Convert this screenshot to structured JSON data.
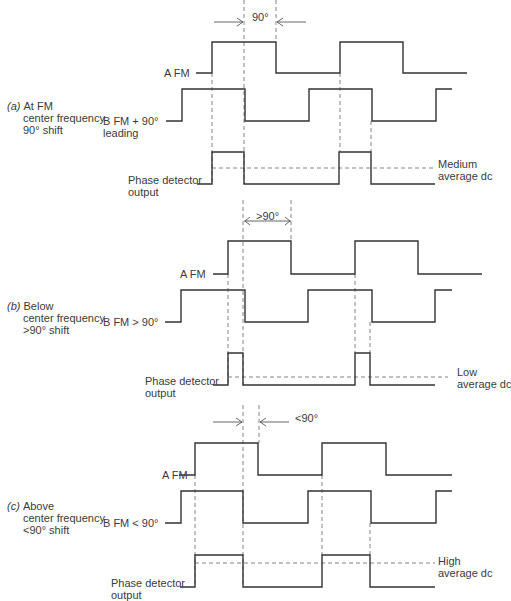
{
  "sections": [
    {
      "id": "a",
      "tag": "(a)",
      "title_lines": [
        "At FM",
        "center frequency",
        "90° shift"
      ],
      "signal_a_label": "A   FM",
      "signal_b_label_lines": [
        "B   FM + 90°",
        "leading"
      ],
      "output_label_lines": [
        "Phase detector",
        "output"
      ],
      "result_lines": [
        "Medium",
        "average dc"
      ],
      "angle_label": "90°",
      "arrow_style": "converging",
      "geom": {
        "a": {
          "hi": 42,
          "lo": 73,
          "pts": [
            [
              196,
              "lo"
            ],
            [
              212,
              "lo"
            ],
            [
              212,
              "hi"
            ],
            [
              276,
              "hi"
            ],
            [
              276,
              "lo"
            ],
            [
              340,
              "lo"
            ],
            [
              340,
              "hi"
            ],
            [
              403,
              "hi"
            ],
            [
              403,
              "lo"
            ],
            [
              467,
              "lo"
            ]
          ]
        },
        "b": {
          "hi": 89,
          "lo": 121,
          "pts": [
            [
              166,
              "lo"
            ],
            [
              182,
              "lo"
            ],
            [
              182,
              "hi"
            ],
            [
              245,
              "hi"
            ],
            [
              245,
              "lo"
            ],
            [
              309,
              "lo"
            ],
            [
              309,
              "hi"
            ],
            [
              372,
              "hi"
            ],
            [
              372,
              "lo"
            ],
            [
              436,
              "lo"
            ],
            [
              436,
              "hi"
            ],
            [
              452,
              "hi"
            ]
          ]
        },
        "out": {
          "hi": 152,
          "lo": 184,
          "pts": [
            [
              197,
              "lo"
            ],
            [
              212,
              "lo"
            ],
            [
              212,
              "hi"
            ],
            [
              244,
              "hi"
            ],
            [
              244,
              "lo"
            ],
            [
              339,
              "lo"
            ],
            [
              339,
              "hi"
            ],
            [
              371,
              "hi"
            ],
            [
              371,
              "lo"
            ],
            [
              435,
              "lo"
            ]
          ]
        },
        "avg": {
          "y": 168,
          "x1": 212,
          "x2": 435
        },
        "vdash": [
          [
            212,
            73,
            184
          ],
          [
            244,
            0,
            184
          ],
          [
            276,
            0,
            42
          ],
          [
            340,
            73,
            152
          ],
          [
            371,
            121,
            152
          ]
        ],
        "arrow": {
          "y": 22,
          "x1": 244,
          "x2": 276,
          "text_x": 252,
          "text_y": 12
        }
      },
      "label_pos": {
        "title": [
          7,
          100
        ],
        "a": [
          164,
          67
        ],
        "b": [
          103,
          115
        ],
        "out": [
          128,
          174
        ],
        "result": [
          438,
          158
        ]
      }
    },
    {
      "id": "b",
      "tag": "(b)",
      "title_lines": [
        "Below",
        "center frequency",
        ">90° shift"
      ],
      "signal_a_label": "A   FM",
      "signal_b_label_lines": [
        "B   FM > 90°"
      ],
      "output_label_lines": [
        "Phase detector",
        "output"
      ],
      "result_lines": [
        "Low",
        "average dc"
      ],
      "angle_label": ">90°",
      "arrow_style": "double",
      "geom": {
        "a": {
          "hi": 241,
          "lo": 274,
          "pts": [
            [
              213,
              "lo"
            ],
            [
              228,
              "lo"
            ],
            [
              228,
              "hi"
            ],
            [
              291,
              "hi"
            ],
            [
              291,
              "lo"
            ],
            [
              355,
              "lo"
            ],
            [
              355,
              "hi"
            ],
            [
              418,
              "hi"
            ],
            [
              418,
              "lo"
            ],
            [
              482,
              "lo"
            ]
          ]
        },
        "b": {
          "hi": 290,
          "lo": 322,
          "pts": [
            [
              165,
              "lo"
            ],
            [
              181,
              "lo"
            ],
            [
              181,
              "hi"
            ],
            [
              245,
              "hi"
            ],
            [
              245,
              "lo"
            ],
            [
              308,
              "lo"
            ],
            [
              308,
              "hi"
            ],
            [
              372,
              "hi"
            ],
            [
              372,
              "lo"
            ],
            [
              435,
              "lo"
            ],
            [
              435,
              "hi"
            ],
            [
              452,
              "hi"
            ]
          ]
        },
        "out": {
          "hi": 353,
          "lo": 385,
          "pts": [
            [
              213,
              "lo"
            ],
            [
              228,
              "lo"
            ],
            [
              228,
              "hi"
            ],
            [
              243,
              "hi"
            ],
            [
              243,
              "lo"
            ],
            [
              355,
              "lo"
            ],
            [
              355,
              "hi"
            ],
            [
              370,
              "hi"
            ],
            [
              370,
              "lo"
            ],
            [
              435,
              "lo"
            ]
          ]
        },
        "avg": {
          "y": 377,
          "x1": 228,
          "x2": 448
        },
        "vdash": [
          [
            228,
            274,
            385
          ],
          [
            243,
            200,
            385
          ],
          [
            291,
            200,
            241
          ],
          [
            355,
            274,
            353
          ],
          [
            370,
            322,
            353
          ]
        ],
        "arrow": {
          "y": 221,
          "x1": 244,
          "x2": 291,
          "text_x": 256,
          "text_y": 211
        }
      },
      "label_pos": {
        "title": [
          7,
          300
        ],
        "a": [
          180,
          268
        ],
        "b": [
          103,
          316
        ],
        "out": [
          145,
          375
        ],
        "result": [
          457,
          366
        ]
      }
    },
    {
      "id": "c",
      "tag": "(c)",
      "title_lines": [
        "Above",
        "center frequency",
        "<90° shift"
      ],
      "signal_a_label": "A   FM",
      "signal_b_label_lines": [
        "B   FM < 90°"
      ],
      "output_label_lines": [
        "Phase detector",
        "output"
      ],
      "result_lines": [
        "High",
        "average dc"
      ],
      "angle_label": "<90°",
      "arrow_style": "converging",
      "geom": {
        "a": {
          "hi": 443,
          "lo": 475,
          "pts": [
            [
              179,
              "lo"
            ],
            [
              195,
              "lo"
            ],
            [
              195,
              "hi"
            ],
            [
              258,
              "hi"
            ],
            [
              258,
              "lo"
            ],
            [
              322,
              "lo"
            ],
            [
              322,
              "hi"
            ],
            [
              386,
              "hi"
            ],
            [
              386,
              "lo"
            ],
            [
              452,
              "lo"
            ]
          ]
        },
        "b": {
          "hi": 491,
          "lo": 523,
          "pts": [
            [
              165,
              "lo"
            ],
            [
              181,
              "lo"
            ],
            [
              181,
              "hi"
            ],
            [
              243,
              "hi"
            ],
            [
              243,
              "lo"
            ],
            [
              308,
              "lo"
            ],
            [
              308,
              "hi"
            ],
            [
              371,
              "hi"
            ],
            [
              371,
              "lo"
            ],
            [
              436,
              "lo"
            ],
            [
              436,
              "hi"
            ],
            [
              452,
              "hi"
            ]
          ]
        },
        "out": {
          "hi": 555,
          "lo": 587,
          "pts": [
            [
              180,
              "lo"
            ],
            [
              195,
              "lo"
            ],
            [
              195,
              "hi"
            ],
            [
              243,
              "hi"
            ],
            [
              243,
              "lo"
            ],
            [
              322,
              "lo"
            ],
            [
              322,
              "hi"
            ],
            [
              370,
              "hi"
            ],
            [
              370,
              "lo"
            ],
            [
              435,
              "lo"
            ]
          ]
        },
        "avg": {
          "y": 563,
          "x1": 195,
          "x2": 435
        },
        "vdash": [
          [
            195,
            475,
            587
          ],
          [
            243,
            405,
            587
          ],
          [
            259,
            405,
            443
          ],
          [
            322,
            475,
            555
          ],
          [
            370,
            523,
            555
          ]
        ],
        "arrow": {
          "y": 422,
          "x1": 243,
          "x2": 259,
          "text_x": 295,
          "text_y": 413
        }
      },
      "label_pos": {
        "title": [
          7,
          500
        ],
        "a": [
          162,
          469
        ],
        "b": [
          103,
          517
        ],
        "out": [
          111,
          577
        ],
        "result": [
          438,
          555
        ]
      }
    }
  ]
}
